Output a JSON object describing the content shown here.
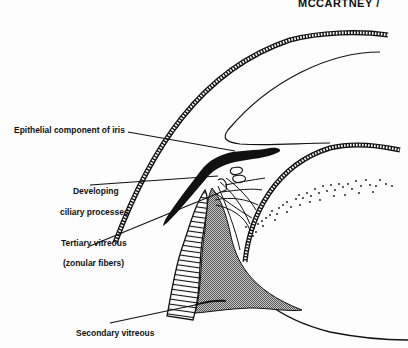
{
  "header": {
    "running_head": "MCCARTNEY   /"
  },
  "figure": {
    "labels": [
      {
        "id": "iris",
        "text": "Epithelial component of iris"
      },
      {
        "id": "ciliary-1",
        "text": "Developing"
      },
      {
        "id": "ciliary-2",
        "text": "ciliary processes"
      },
      {
        "id": "tertiary-1",
        "text": "Tertiary vitreous"
      },
      {
        "id": "tertiary-2",
        "text": "(zonular fibers)"
      },
      {
        "id": "secondary",
        "text": "Secondary vitreous"
      }
    ],
    "colors": {
      "ink": "#111111",
      "paper": "#fdfdfd",
      "stipple": "#9a9a9a"
    }
  }
}
